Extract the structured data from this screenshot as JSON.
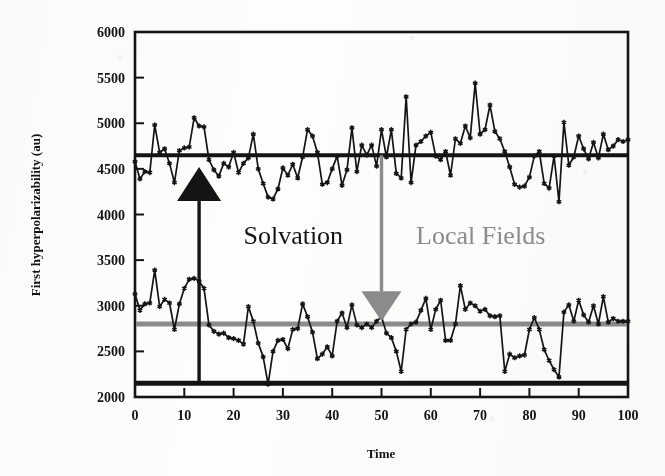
{
  "figure": {
    "background_color": "#fdfdfc",
    "frame_color": "#141414"
  },
  "chart_data": {
    "type": "line",
    "title": "",
    "xlabel": "Time",
    "ylabel": "First hyperpolarizability (au)",
    "xlim": [
      0,
      100
    ],
    "ylim": [
      2000,
      6000
    ],
    "xticks": [
      0,
      10,
      20,
      30,
      40,
      50,
      60,
      70,
      80,
      90,
      100
    ],
    "yticks": [
      2000,
      2500,
      3000,
      3500,
      4000,
      4500,
      5000,
      5500,
      6000
    ],
    "xticklabels": [
      "0",
      "10",
      "20",
      "30",
      "40",
      "50",
      "60",
      "70",
      "80",
      "90",
      "100"
    ],
    "yticklabels": [
      "2000",
      "2500",
      "3000",
      "3500",
      "4000",
      "4500",
      "5000",
      "5500",
      "6000"
    ],
    "grid": false,
    "legend": null,
    "marker": "star",
    "series": [
      {
        "name": "upper-trace",
        "color": "#141414",
        "description": "noisy first hyperpolarizability trace fluctuating about 4650 au",
        "x": [
          0,
          1,
          2,
          3,
          4,
          5,
          6,
          7,
          8,
          9,
          10,
          11,
          12,
          13,
          14,
          15,
          16,
          17,
          18,
          19,
          20,
          21,
          22,
          23,
          24,
          25,
          26,
          27,
          28,
          29,
          30,
          31,
          32,
          33,
          34,
          35,
          36,
          37,
          38,
          39,
          40,
          41,
          42,
          43,
          44,
          45,
          46,
          47,
          48,
          49,
          50,
          51,
          52,
          53,
          54,
          55,
          56,
          57,
          58,
          59,
          60,
          61,
          62,
          63,
          64,
          65,
          66,
          67,
          68,
          69,
          70,
          71,
          72,
          73,
          74,
          75,
          76,
          77,
          78,
          79,
          80,
          81,
          82,
          83,
          84,
          85,
          86,
          87,
          88,
          89,
          90,
          91,
          92,
          93,
          94,
          95,
          96,
          97,
          98,
          99,
          100
        ],
        "values": [
          4580,
          4390,
          4470,
          4460,
          4980,
          4680,
          4720,
          4560,
          4350,
          4700,
          4730,
          4740,
          5060,
          4970,
          4960,
          4600,
          4490,
          4420,
          4560,
          4520,
          4680,
          4460,
          4560,
          4620,
          4880,
          4500,
          4340,
          4190,
          4170,
          4280,
          4510,
          4430,
          4550,
          4400,
          4630,
          4930,
          4860,
          4680,
          4330,
          4350,
          4500,
          4640,
          4320,
          4490,
          4950,
          4470,
          4760,
          4650,
          4760,
          4530,
          4930,
          4630,
          4930,
          4450,
          4400,
          5290,
          4350,
          4760,
          4800,
          4860,
          4900,
          4640,
          4600,
          4690,
          4430,
          4830,
          4780,
          4970,
          4840,
          5440,
          4880,
          4930,
          5200,
          4910,
          4830,
          4690,
          4520,
          4330,
          4300,
          4310,
          4410,
          4640,
          4690,
          4340,
          4290,
          4640,
          4140,
          5010,
          4540,
          4630,
          4860,
          4720,
          4610,
          4790,
          4620,
          4880,
          4710,
          4750,
          4820,
          4800,
          4820
        ]
      },
      {
        "name": "lower-trace",
        "color": "#141414",
        "description": "noisy first hyperpolarizability trace fluctuating about 2800 au",
        "x": [
          0,
          1,
          2,
          3,
          4,
          5,
          6,
          7,
          8,
          9,
          10,
          11,
          12,
          13,
          14,
          15,
          16,
          17,
          18,
          19,
          20,
          21,
          22,
          23,
          24,
          25,
          26,
          27,
          28,
          29,
          30,
          31,
          32,
          33,
          34,
          35,
          36,
          37,
          38,
          39,
          40,
          41,
          42,
          43,
          44,
          45,
          46,
          47,
          48,
          49,
          50,
          51,
          52,
          53,
          54,
          55,
          56,
          57,
          58,
          59,
          60,
          61,
          62,
          63,
          64,
          65,
          66,
          67,
          68,
          69,
          70,
          71,
          72,
          73,
          74,
          75,
          76,
          77,
          78,
          79,
          80,
          81,
          82,
          83,
          84,
          85,
          86,
          87,
          88,
          89,
          90,
          91,
          92,
          93,
          94,
          95,
          96,
          97,
          98,
          99,
          100
        ],
        "values": [
          3130,
          2950,
          3020,
          3030,
          3390,
          2990,
          3070,
          3030,
          2740,
          3020,
          3190,
          3290,
          3300,
          3270,
          3190,
          2790,
          2720,
          2690,
          2700,
          2650,
          2640,
          2620,
          2580,
          2990,
          2830,
          2590,
          2440,
          2140,
          2500,
          2620,
          2630,
          2530,
          2740,
          2750,
          3020,
          2880,
          2710,
          2420,
          2470,
          2550,
          2450,
          2830,
          2920,
          2760,
          3010,
          2790,
          2760,
          2800,
          2760,
          2830,
          2880,
          2700,
          2650,
          2500,
          2280,
          2740,
          2800,
          2820,
          2950,
          3080,
          2740,
          2960,
          3060,
          2620,
          2620,
          2800,
          3220,
          2960,
          3030,
          3000,
          2940,
          2960,
          2890,
          2880,
          2890,
          2280,
          2470,
          2430,
          2450,
          2460,
          2740,
          2870,
          2740,
          2520,
          2400,
          2300,
          2220,
          2930,
          3010,
          2830,
          3060,
          2900,
          2820,
          3000,
          2800,
          3100,
          2820,
          2860,
          2830,
          2830,
          2830
        ]
      }
    ],
    "reference_lines": [
      {
        "name": "upper-mean-line",
        "y": 4650,
        "color": "#141414",
        "width": 4,
        "style": "solid"
      },
      {
        "name": "lower-mean-line",
        "y": 2800,
        "color": "#8c8c8c",
        "width": 5,
        "style": "solid"
      },
      {
        "name": "baseline-line",
        "y": 2150,
        "color": "#141414",
        "width": 5,
        "style": "solid"
      }
    ],
    "annotations": [
      {
        "name": "solvation-arrow",
        "label": "Solvation",
        "color": "#141414",
        "x": 13,
        "y_from": 2150,
        "y_to": 4520,
        "direction": "up",
        "label_x": 22,
        "label_y": 3680
      },
      {
        "name": "local-fields-arrow",
        "label": "Local Fields",
        "color": "#8c8c8c",
        "x": 50,
        "y_from": 4650,
        "y_to": 2830,
        "direction": "down",
        "label_x": 57,
        "label_y": 3680
      }
    ]
  }
}
